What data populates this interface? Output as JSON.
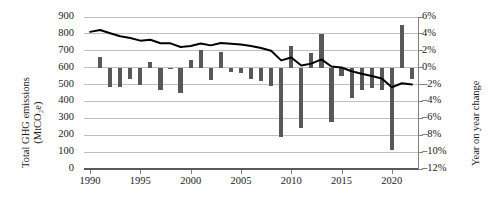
{
  "axes": {
    "left_title_line1": "Total GHG emissions",
    "left_title_line2": "(MtCO₂e)",
    "right_title": "Year on year change",
    "left_ticks": [
      "900",
      "800",
      "700",
      "600",
      "500",
      "400",
      "300",
      "200",
      "100",
      "0"
    ],
    "right_ticks": [
      "6%",
      "4%",
      "2%",
      "0%",
      "–2%",
      "–4%",
      "–6%",
      "–8%",
      "–10%",
      "–12%"
    ],
    "x_ticks": [
      "1990",
      "1995",
      "2000",
      "2005",
      "2010",
      "2015",
      "2020"
    ]
  },
  "chart_data": {
    "type": "bar",
    "title": "",
    "xlabel": "",
    "ylabel": "Total GHG emissions (MtCO2e)",
    "y2label": "Year on year change",
    "ylim": [
      0,
      900
    ],
    "y2lim": [
      -12,
      6
    ],
    "xlim": [
      1989.4,
      2022.6
    ],
    "grid": true,
    "legend": "none",
    "bar_color": "#585858",
    "line_color": "#000000",
    "x": [
      1990,
      1991,
      1992,
      1993,
      1994,
      1995,
      1996,
      1997,
      1998,
      1999,
      2000,
      2001,
      2002,
      2003,
      2004,
      2005,
      2006,
      2007,
      2008,
      2009,
      2010,
      2011,
      2012,
      2013,
      2014,
      2015,
      2016,
      2017,
      2018,
      2019,
      2020,
      2021,
      2022
    ],
    "series": [
      {
        "name": "Year on year change",
        "type": "bar",
        "axis": "right",
        "unit": "%",
        "values": [
          null,
          1.3,
          -2.3,
          -2.3,
          -1.4,
          -2.0,
          0.7,
          -2.6,
          -0.1,
          -3.0,
          0.9,
          2.1,
          -1.5,
          1.9,
          -0.5,
          -0.6,
          -1.3,
          -1.6,
          -2.2,
          -8.2,
          2.6,
          -7.1,
          1.7,
          4.0,
          -6.4,
          -1.0,
          -3.6,
          -2.6,
          -2.4,
          -2.6,
          -9.7,
          5.0,
          -1.4
        ]
      },
      {
        "name": "Total GHG emissions",
        "type": "line",
        "axis": "left",
        "unit": "MtCO2e",
        "values": [
          812,
          823,
          804,
          786,
          776,
          760,
          765,
          745,
          744,
          722,
          728,
          743,
          732,
          746,
          742,
          737,
          728,
          716,
          700,
          643,
          660,
          613,
          624,
          649,
          607,
          601,
          579,
          564,
          551,
          536,
          484,
          508,
          501
        ]
      }
    ]
  }
}
